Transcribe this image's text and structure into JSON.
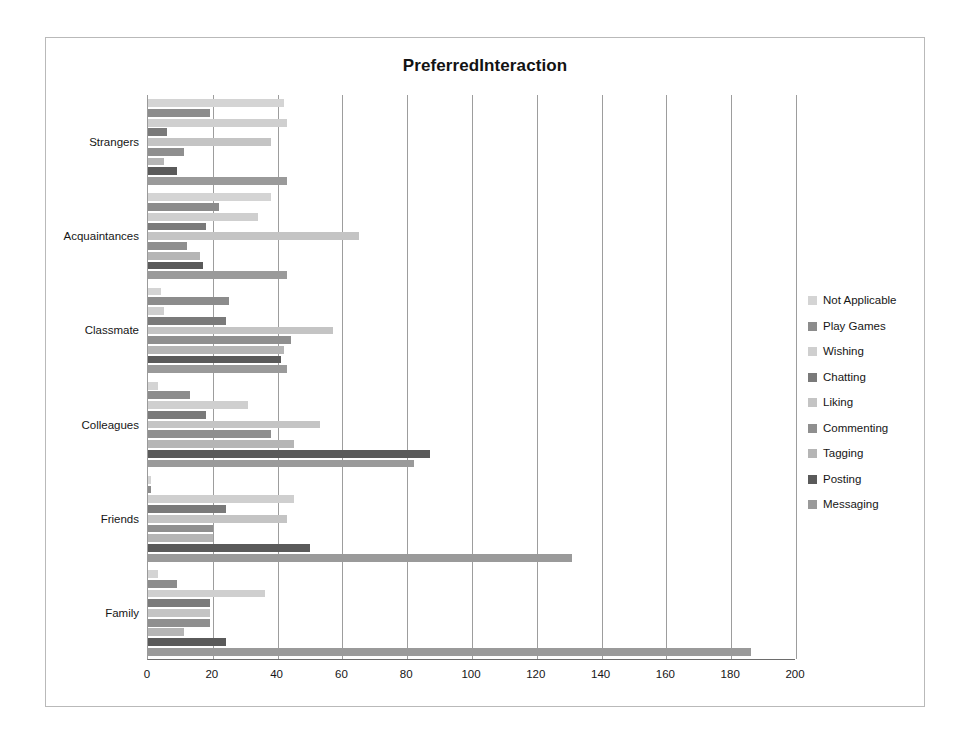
{
  "chart_data": {
    "type": "bar",
    "orientation": "horizontal",
    "title": "PreferredInteraction",
    "xlabel": "",
    "ylabel": "",
    "xlim": [
      0,
      200
    ],
    "xticks": [
      0,
      20,
      40,
      60,
      80,
      100,
      120,
      140,
      160,
      180,
      200
    ],
    "grid": true,
    "legend_position": "right",
    "categories": [
      "Family",
      "Friends",
      "Colleagues",
      "Classmate",
      "Acquaintances",
      "Strangers"
    ],
    "categories_top_to_bottom": [
      "Strangers",
      "Acquaintances",
      "Classmate",
      "Colleagues",
      "Friends",
      "Family"
    ],
    "series_order_top_to_bottom": [
      "Not Applicable",
      "Play Games",
      "Wishing",
      "Chatting",
      "Liking",
      "Commenting",
      "Tagging",
      "Posting",
      "Messaging"
    ],
    "series": [
      {
        "name": "Not Applicable",
        "color": "#d4d4d4",
        "values": [
          3,
          1,
          3,
          4,
          38,
          42
        ]
      },
      {
        "name": "Play Games",
        "color": "#8c8c8c",
        "values": [
          9,
          1,
          13,
          25,
          22,
          19
        ]
      },
      {
        "name": "Wishing",
        "color": "#cfcfcf",
        "values": [
          36,
          45,
          31,
          5,
          34,
          43
        ]
      },
      {
        "name": "Chatting",
        "color": "#7a7a7a",
        "values": [
          19,
          24,
          18,
          24,
          18,
          6
        ]
      },
      {
        "name": "Liking",
        "color": "#c4c4c4",
        "values": [
          19,
          43,
          53,
          57,
          65,
          38
        ]
      },
      {
        "name": "Commenting",
        "color": "#8f8f8f",
        "values": [
          19,
          20,
          38,
          44,
          12,
          11
        ]
      },
      {
        "name": "Tagging",
        "color": "#b5b5b5",
        "values": [
          11,
          20,
          45,
          42,
          16,
          5
        ]
      },
      {
        "name": "Posting",
        "color": "#5a5a5a",
        "values": [
          24,
          50,
          87,
          41,
          17,
          9
        ]
      },
      {
        "name": "Messaging",
        "color": "#9a9a9a",
        "values": [
          186,
          131,
          82,
          43,
          43,
          43
        ]
      }
    ]
  },
  "legend": {
    "items": [
      {
        "label": "Not Applicable",
        "color": "#d4d4d4"
      },
      {
        "label": "Play Games",
        "color": "#8c8c8c"
      },
      {
        "label": "Wishing",
        "color": "#cfcfcf"
      },
      {
        "label": "Chatting",
        "color": "#7a7a7a"
      },
      {
        "label": "Liking",
        "color": "#c4c4c4"
      },
      {
        "label": "Commenting",
        "color": "#8f8f8f"
      },
      {
        "label": "Tagging",
        "color": "#b5b5b5"
      },
      {
        "label": "Posting",
        "color": "#5a5a5a"
      },
      {
        "label": "Messaging",
        "color": "#9a9a9a"
      }
    ]
  }
}
